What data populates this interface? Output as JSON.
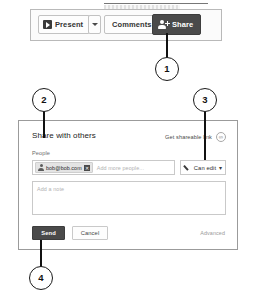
{
  "toolbar": {
    "present_label": "Present",
    "present_icon": "play-screen-icon",
    "present_dropdown_icon": "chevron-down-icon",
    "comments_label": "Comments",
    "share_label": "Share",
    "share_icon": "person-add-icon"
  },
  "dialog": {
    "title": "Share with others",
    "shareable_link_label": "Get shareable link",
    "shareable_link_icon": "link-icon",
    "people_label": "People",
    "people_field": {
      "chip": {
        "avatar_icon": "person-icon",
        "email": "bob@bob.com",
        "remove_icon": "close-icon"
      },
      "placeholder": "Add more people..."
    },
    "permission": {
      "icon": "pencil-icon",
      "label": "Can edit",
      "caret_icon": "chevron-down-icon"
    },
    "note": {
      "placeholder": "Add a note"
    },
    "send_label": "Send",
    "cancel_label": "Cancel",
    "advanced_label": "Advanced"
  },
  "callouts": [
    {
      "number": "1",
      "target": "share-button"
    },
    {
      "number": "2",
      "target": "share-dialog-top-left"
    },
    {
      "number": "3",
      "target": "can-edit-dropdown"
    },
    {
      "number": "4",
      "target": "send-button"
    }
  ],
  "colors": {
    "accent_dark": "#4a4a4a",
    "panel_bg": "#fbfbfb",
    "border": "#c9c9c9",
    "placeholder": "#b2b2b2",
    "annotation": "#111111"
  }
}
